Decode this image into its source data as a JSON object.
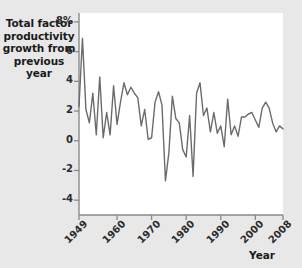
{
  "chart_data": {
    "type": "line",
    "title": "Total factor productivity growth from previous year",
    "xlabel": "Year",
    "ylabel": "",
    "xlim": [
      1949,
      2008
    ],
    "ylim": [
      -5,
      8.6
    ],
    "grid": false,
    "legend": "none",
    "line_color": "#6b6b6b",
    "plot_background": "#ffffff",
    "figure_background": "#e8e8e8",
    "yticks": [
      8,
      6,
      4,
      2,
      0,
      -2,
      -4
    ],
    "ytick_labels": [
      "8%",
      "6",
      "4",
      "2",
      "0",
      "-2",
      "-4"
    ],
    "xticks": [
      1949,
      1960,
      1970,
      1980,
      1990,
      2000,
      2008
    ],
    "xtick_labels": [
      "1949",
      "1960",
      "1970",
      "1980",
      "1990",
      "2000",
      "2008"
    ],
    "x": [
      1949,
      1950,
      1951,
      1952,
      1953,
      1954,
      1955,
      1956,
      1957,
      1958,
      1959,
      1960,
      1961,
      1962,
      1963,
      1964,
      1965,
      1966,
      1967,
      1968,
      1969,
      1970,
      1971,
      1972,
      1973,
      1974,
      1975,
      1976,
      1977,
      1978,
      1979,
      1980,
      1981,
      1982,
      1983,
      1984,
      1985,
      1986,
      1987,
      1988,
      1989,
      1990,
      1991,
      1992,
      1993,
      1994,
      1995,
      1996,
      1997,
      1998,
      1999,
      2000,
      2001,
      2002,
      2003,
      2004,
      2005,
      2006,
      2007,
      2008
    ],
    "values": [
      2.3,
      6.9,
      2.1,
      1.2,
      3.2,
      0.4,
      4.3,
      0.2,
      1.9,
      0.4,
      3.7,
      1.1,
      2.6,
      3.9,
      3.1,
      3.6,
      3.2,
      2.9,
      1.0,
      2.1,
      0.1,
      0.2,
      2.6,
      3.3,
      2.4,
      -2.7,
      -0.8,
      3.0,
      1.5,
      1.2,
      -0.6,
      -1.1,
      1.7,
      -2.4,
      3.2,
      3.9,
      1.7,
      2.2,
      0.6,
      1.9,
      0.5,
      1.0,
      -0.4,
      2.8,
      0.4,
      1.0,
      0.3,
      1.6,
      1.6,
      1.8,
      1.9,
      1.4,
      0.9,
      2.2,
      2.6,
      2.2,
      1.2,
      0.6,
      1.0,
      0.8
    ]
  }
}
